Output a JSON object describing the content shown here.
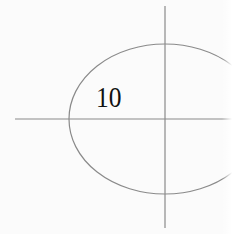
{
  "diagram": {
    "label": "10",
    "colors": {
      "background": "#fbfbfb",
      "stroke": "#8a8a8a",
      "text": "#111111"
    },
    "ellipse": {
      "cx": 165,
      "cy": 119,
      "rx": 96,
      "ry": 75
    },
    "axes": {
      "horizontal": {
        "x1": 15,
        "y": 119,
        "x2": 232
      },
      "vertical": {
        "x": 165,
        "y1": 6,
        "y2": 228
      }
    }
  }
}
